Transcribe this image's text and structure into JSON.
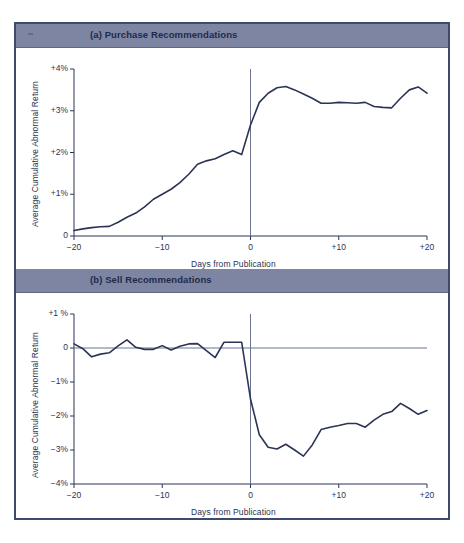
{
  "figure": {
    "frame_color": "#3d4a6b",
    "header_bar_color": "#7d85a3",
    "line_color": "#2b3454",
    "axis_color": "#2b3454",
    "background": "#ffffff"
  },
  "panels": [
    {
      "id": "purchase",
      "header": "(a) Purchase Recommendations",
      "ylabel": "Average Cumulative Abnormal Return",
      "xlabel": "Days from Publication",
      "y_ticks": [
        "+4%",
        "+3%",
        "+2%",
        "+1%",
        "0"
      ],
      "x_ticks": [
        "−20",
        "−10",
        "0",
        "+10",
        "+20"
      ]
    },
    {
      "id": "sell",
      "header": "(b) Sell Recommendations",
      "ylabel": "Average Cumulative Abnormal Return",
      "xlabel": "Days from Publication",
      "y_ticks": [
        "+1 %",
        "0",
        "−1%",
        "−2%",
        "−3%",
        "−4%"
      ],
      "x_ticks": [
        "−20",
        "−10",
        "0",
        "+10",
        "+20"
      ]
    }
  ],
  "chart_data": [
    {
      "type": "line",
      "title": "(a) Purchase Recommendations",
      "xlabel": "Days from Publication",
      "ylabel": "Average Cumulative Abnormal Return",
      "xlim": [
        -20,
        20
      ],
      "ylim": [
        0,
        4
      ],
      "xtick_values": [
        -20,
        -10,
        0,
        10,
        20
      ],
      "xtick_labels": [
        "−20",
        "−10",
        "0",
        "+10",
        "+20"
      ],
      "ytick_values": [
        0,
        1,
        2,
        3,
        4
      ],
      "ytick_labels": [
        "0",
        "+1%",
        "+2%",
        "+3%",
        "+4%"
      ],
      "grid": false,
      "legend": null,
      "annotations": [
        {
          "type": "vline",
          "x": 0,
          "label": "publication day"
        }
      ],
      "x": [
        -20,
        -19,
        -18,
        -17,
        -16,
        -15,
        -14,
        -13,
        -12,
        -11,
        -10,
        -9,
        -8,
        -7,
        -6,
        -5,
        -4,
        -3,
        -2,
        -1,
        0,
        1,
        2,
        3,
        4,
        5,
        6,
        7,
        8,
        9,
        10,
        11,
        12,
        13,
        14,
        15,
        16,
        17,
        18,
        19,
        20
      ],
      "y": [
        0.13,
        0.17,
        0.2,
        0.22,
        0.23,
        0.33,
        0.45,
        0.55,
        0.7,
        0.88,
        1.0,
        1.12,
        1.28,
        1.48,
        1.72,
        1.8,
        1.85,
        1.95,
        2.04,
        1.95,
        2.66,
        3.2,
        3.42,
        3.55,
        3.58,
        3.5,
        3.4,
        3.3,
        3.18,
        3.18,
        3.2,
        3.19,
        3.18,
        3.2,
        3.1,
        3.08,
        3.07,
        3.3,
        3.5,
        3.57,
        3.42
      ]
    },
    {
      "type": "line",
      "title": "(b) Sell Recommendations",
      "xlabel": "Days from Publication",
      "ylabel": "Average Cumulative Abnormal Return",
      "xlim": [
        -20,
        20
      ],
      "ylim": [
        -4,
        1
      ],
      "xtick_values": [
        -20,
        -10,
        0,
        10,
        20
      ],
      "xtick_labels": [
        "−20",
        "−10",
        "0",
        "+10",
        "+20"
      ],
      "ytick_values": [
        1,
        0,
        -1,
        -2,
        -3,
        -4
      ],
      "ytick_labels": [
        "+1 %",
        "0",
        "−1%",
        "−2%",
        "−3%",
        "−4%"
      ],
      "grid": false,
      "legend": null,
      "annotations": [
        {
          "type": "vline",
          "x": 0,
          "label": "publication day"
        },
        {
          "type": "hline",
          "y": 0,
          "label": "zero return"
        }
      ],
      "x": [
        -20,
        -19,
        -18,
        -17,
        -16,
        -15,
        -14,
        -13,
        -12,
        -11,
        -10,
        -9,
        -8,
        -7,
        -6,
        -5,
        -4,
        -3,
        -2,
        -1,
        0,
        1,
        2,
        3,
        4,
        5,
        6,
        7,
        8,
        9,
        10,
        11,
        12,
        13,
        14,
        15,
        16,
        17,
        18,
        19,
        20
      ],
      "y": [
        0.12,
        -0.02,
        -0.26,
        -0.18,
        -0.14,
        0.06,
        0.24,
        0.02,
        -0.04,
        -0.04,
        0.07,
        -0.06,
        0.05,
        0.12,
        0.13,
        -0.08,
        -0.28,
        0.17,
        0.17,
        0.17,
        -1.5,
        -2.55,
        -2.92,
        -2.97,
        -2.83,
        -3.0,
        -3.18,
        -2.85,
        -2.4,
        -2.33,
        -2.28,
        -2.22,
        -2.22,
        -2.33,
        -2.12,
        -1.95,
        -1.87,
        -1.63,
        -1.78,
        -1.95,
        -1.84
      ]
    }
  ]
}
